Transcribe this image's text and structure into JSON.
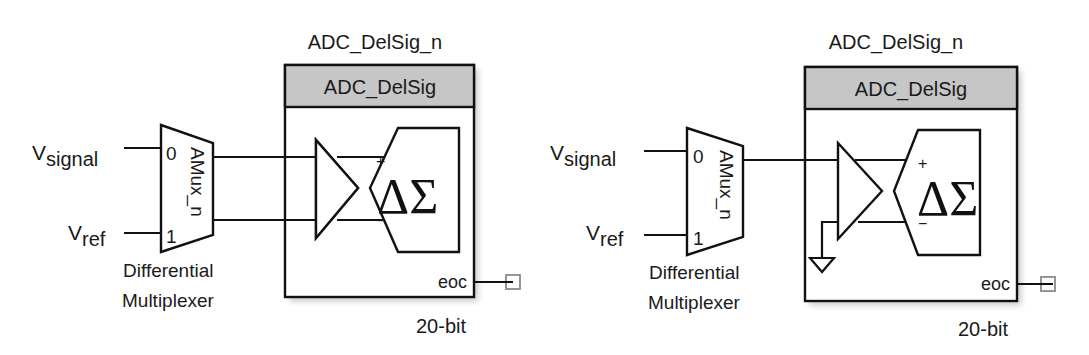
{
  "diagrams": [
    {
      "id": "left",
      "variant": "differential",
      "component_instance": "ADC_DelSig_n",
      "component_type": "ADC_DelSig",
      "resolution": "20-bit",
      "output_pin": "eoc",
      "mux": {
        "name": "AMux_n",
        "input_0": "0",
        "input_1": "1",
        "caption_line1": "Differential",
        "caption_line2": "Multiplexer"
      },
      "inputs": {
        "signal_main": "V",
        "signal_sub": "signal",
        "ref_main": "V",
        "ref_sub": "ref"
      },
      "modulator": {
        "symbol": "ΔΣ",
        "plus": "+",
        "minus": "−"
      },
      "negative_input_grounded": false
    },
    {
      "id": "right",
      "variant": "single-ended",
      "component_instance": "ADC_DelSig_n",
      "component_type": "ADC_DelSig",
      "resolution": "20-bit",
      "output_pin": "eoc",
      "mux": {
        "name": "AMux_n",
        "input_0": "0",
        "input_1": "1",
        "caption_line1": "Differential",
        "caption_line2": "Multiplexer"
      },
      "inputs": {
        "signal_main": "V",
        "signal_sub": "signal",
        "ref_main": "V",
        "ref_sub": "ref"
      },
      "modulator": {
        "symbol": "ΔΣ",
        "plus": "+",
        "minus": "−"
      },
      "negative_input_grounded": true
    }
  ],
  "colors": {
    "header_fill": "#c6c6c6",
    "stroke": "#111111",
    "terminal_stroke": "#8a8a8a",
    "background": "#ffffff"
  }
}
